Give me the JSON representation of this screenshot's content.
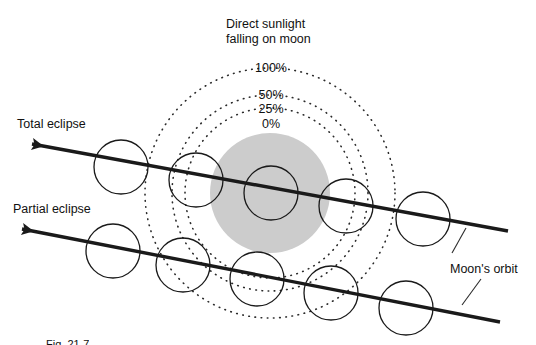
{
  "figure": {
    "kind": "diagram",
    "topic": "lunar-eclipse-sunlight-shading",
    "background_color": "#ffffff",
    "stroke_color": "#1a1a1a",
    "shadow_fill": "#cccccc"
  },
  "labels": {
    "heading_line1": "Direct sunlight",
    "heading_line2": "falling on moon",
    "total_eclipse": "Total eclipse",
    "partial_eclipse": "Partial eclipse",
    "moons_orbit": "Moon's orbit"
  },
  "percent_rings": [
    {
      "label": "100%",
      "radius": 125
    },
    {
      "label": "50%",
      "radius": 98
    },
    {
      "label": "25%",
      "radius": 85
    },
    {
      "label": "0%",
      "radius": 60
    }
  ],
  "umbra": {
    "center_x": 270,
    "center_y": 193,
    "radius": 60,
    "fill": "#cccccc"
  },
  "paths": {
    "total_eclipse_track": {
      "x1": 508,
      "y1": 231,
      "x2": 32,
      "y2": 144,
      "arrow_at": "left"
    },
    "partial_eclipse_track": {
      "x1": 500,
      "y1": 322,
      "x2": 22,
      "y2": 229,
      "arrow_at": "left"
    }
  },
  "moon_positions": {
    "total_eclipse_row": [
      {
        "cx": 121,
        "cy": 167,
        "r": 27
      },
      {
        "cx": 196,
        "cy": 180,
        "r": 27
      },
      {
        "cx": 271,
        "cy": 193,
        "r": 27
      },
      {
        "cx": 346,
        "cy": 206,
        "r": 27
      },
      {
        "cx": 423,
        "cy": 219,
        "r": 27
      }
    ],
    "partial_eclipse_row": [
      {
        "cx": 113,
        "cy": 251,
        "r": 27
      },
      {
        "cx": 183,
        "cy": 265,
        "r": 27
      },
      {
        "cx": 257,
        "cy": 279,
        "r": 27
      },
      {
        "cx": 331,
        "cy": 293,
        "r": 27
      },
      {
        "cx": 406,
        "cy": 308,
        "r": 27
      }
    ]
  },
  "leader_lines": [
    {
      "x1": 466,
      "y1": 228,
      "x2": 452,
      "y2": 253
    },
    {
      "x1": 481,
      "y1": 279,
      "x2": 462,
      "y2": 305
    }
  ],
  "caption": "Fig. 21-7"
}
